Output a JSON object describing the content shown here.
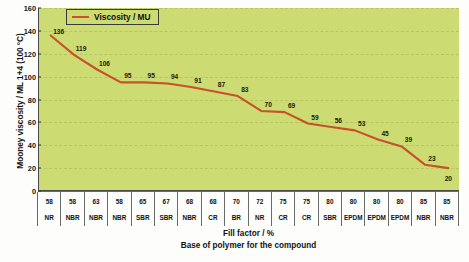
{
  "chart_data": {
    "type": "line",
    "title": "",
    "xlabel": "Fill factor / %",
    "xlabel2": "Base of polymer for the compound",
    "ylabel": "Mooney viscosity / ML 1+4 (100 °C)",
    "ylim": [
      0,
      160
    ],
    "ytick_step": 20,
    "yticks": [
      "160",
      "140",
      "120",
      "100",
      "80",
      "60",
      "40",
      "20",
      "0"
    ],
    "grid": true,
    "legend_position": "top-left",
    "series": [
      {
        "name": "Viscosity / MU",
        "color": "#c8502a",
        "values": [
          136,
          119,
          106,
          95,
          95,
          94,
          91,
          87,
          83,
          70,
          69,
          59,
          56,
          53,
          45,
          39,
          23,
          20
        ]
      }
    ],
    "categories": [
      {
        "fill_factor": "58",
        "base": "NR"
      },
      {
        "fill_factor": "58",
        "base": "NBR"
      },
      {
        "fill_factor": "63",
        "base": "NBR"
      },
      {
        "fill_factor": "58",
        "base": "NBR"
      },
      {
        "fill_factor": "65",
        "base": "SBR"
      },
      {
        "fill_factor": "67",
        "base": "SBR"
      },
      {
        "fill_factor": "68",
        "base": "NBR"
      },
      {
        "fill_factor": "68",
        "base": "CR"
      },
      {
        "fill_factor": "70",
        "base": "BR"
      },
      {
        "fill_factor": "72",
        "base": "NR"
      },
      {
        "fill_factor": "75",
        "base": "CR"
      },
      {
        "fill_factor": "75",
        "base": "CR"
      },
      {
        "fill_factor": "80",
        "base": "SBR"
      },
      {
        "fill_factor": "80",
        "base": "EPDM"
      },
      {
        "fill_factor": "80",
        "base": "EPDM"
      },
      {
        "fill_factor": "80",
        "base": "EPDM"
      },
      {
        "fill_factor": "85",
        "base": "NBR"
      },
      {
        "fill_factor": "85",
        "base": "NBR"
      }
    ]
  },
  "legend": {
    "label": "Viscosity / MU"
  },
  "colors": {
    "plot_background": "#ccdb72",
    "line": "#c8502a",
    "gridline": "#b9c763",
    "axis": "#4a4a4a"
  }
}
